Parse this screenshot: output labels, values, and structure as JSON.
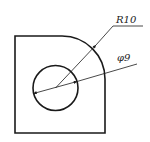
{
  "diagram": {
    "type": "engineering-drawing",
    "colors": {
      "line": "#1a1a1a",
      "background": "#ffffff"
    },
    "part_outline": {
      "shape": "square-with-rounded-corner",
      "corner_radius_label": "R10"
    },
    "hole": {
      "shape": "circle",
      "diameter_label": "φ9"
    },
    "dimensions": [
      {
        "id": "radius",
        "label": "R10"
      },
      {
        "id": "diameter",
        "label": "φ9"
      }
    ]
  }
}
